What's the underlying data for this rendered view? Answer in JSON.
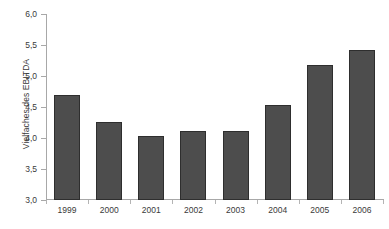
{
  "chart_data": {
    "type": "bar",
    "title": "",
    "subtitle": "",
    "xlabel": "",
    "ylabel": "Vielfaches des EBITDA",
    "categories": [
      "1999",
      "2000",
      "2001",
      "2002",
      "2003",
      "2004",
      "2005",
      "2006"
    ],
    "values": [
      4.69,
      4.26,
      4.04,
      4.11,
      4.12,
      4.54,
      5.17,
      5.42
    ],
    "series": [
      {
        "name": "Vielfaches des EBITDA",
        "values": [
          4.69,
          4.26,
          4.04,
          4.11,
          4.12,
          4.54,
          5.17,
          5.42
        ]
      }
    ],
    "ylim": [
      3.0,
      6.0
    ],
    "ytick_values": [
      6.0,
      5.5,
      5.0,
      4.5,
      4.0,
      3.5,
      3.0
    ],
    "ytick_labels": [
      "6,0",
      "5,5",
      "5,0",
      "4,5",
      "4,0",
      "3,5",
      "3,0"
    ],
    "grid": false,
    "legend": false,
    "legend_position": "none",
    "bar_color": "#4d4d4d",
    "bar_border_color": "#2e2e2e",
    "axis_color": "#a8a8a8",
    "background_color": "#ffffff",
    "text_color": "#3a3a3a",
    "annotations": []
  }
}
